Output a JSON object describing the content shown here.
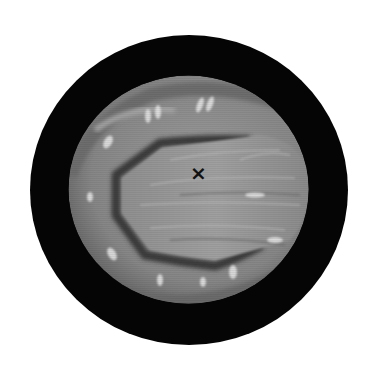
{
  "figure": {
    "type": "endoscopic-view-illustration",
    "background_color": "#ffffff",
    "outer_ring": {
      "color": "#050505",
      "cx": 189,
      "cy": 190,
      "rx": 159,
      "ry": 155
    },
    "view_field": {
      "cx": 188.5,
      "cy": 189.5,
      "rx": 120,
      "ry": 114,
      "base_color": "#8c8c8c"
    },
    "cavity_outline_color": "#3a3a3a",
    "central_mass_color": "#9a9a9a",
    "highlight_color": "#e6e6e6"
  },
  "marker": {
    "symbol": "×",
    "label": "x",
    "x": 198,
    "y": 173,
    "color": "#111111"
  }
}
